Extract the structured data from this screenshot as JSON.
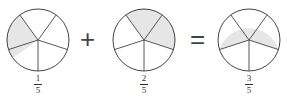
{
  "figure": {
    "operators": {
      "plus": "+",
      "equals": "="
    },
    "fractions": [
      {
        "numerator": "1",
        "denominator": "5",
        "shaded_sectors": 1
      },
      {
        "numerator": "2",
        "denominator": "5",
        "shaded_sectors": 2
      },
      {
        "numerator": "3",
        "denominator": "5",
        "shaded_sectors": 3
      }
    ],
    "colors": {
      "shade": "#e6e6e6",
      "stroke": "#444444",
      "background": "#ffffff"
    }
  }
}
